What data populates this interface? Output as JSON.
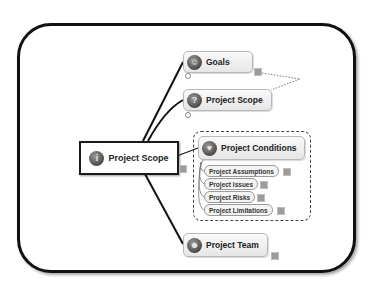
{
  "diagram": {
    "type": "mind-map",
    "central_topic": {
      "label": "Project Scope",
      "icon": "info-icon"
    },
    "topics": [
      {
        "label": "Goals",
        "icon": "smiley-icon",
        "has_note": true
      },
      {
        "label": "Project Scope",
        "icon": "question-icon",
        "has_note": false
      },
      {
        "label": "Project Conditions",
        "icon": "lightbulb-icon",
        "has_note": false,
        "boundary": "dashed",
        "subtopics": [
          {
            "label": "Project Assumptions",
            "has_note": true
          },
          {
            "label": "Project Issues",
            "has_note": true
          },
          {
            "label": "Project Risks",
            "has_note": true
          },
          {
            "label": "Project Limitations",
            "has_note": true
          }
        ]
      },
      {
        "label": "Project Team",
        "icon": "team-icon",
        "has_note": true
      }
    ],
    "relationship": {
      "from": "Goals",
      "to": "Project Scope",
      "style": "dotted"
    }
  },
  "icons": {
    "info": "i",
    "smiley": "☺",
    "question": "?",
    "lightbulb": "♥",
    "team": "☻"
  },
  "colors": {
    "frame_border": "#111111",
    "topic_fill": "#ececec",
    "topic_border": "#b8b8b8",
    "text": "#222222"
  }
}
